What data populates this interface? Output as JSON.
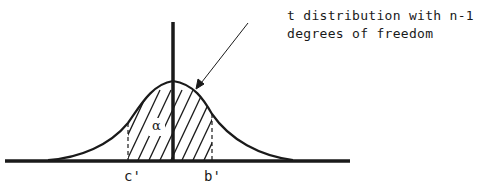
{
  "diagram": {
    "annotation": {
      "line1": "t distribution with n-1",
      "line2": "degrees of freedom"
    },
    "labels": {
      "left_bound": "c'",
      "right_bound": "b'",
      "area": "α"
    },
    "colors": {
      "ink": "#1a1a1a",
      "background": "#ffffff"
    }
  }
}
